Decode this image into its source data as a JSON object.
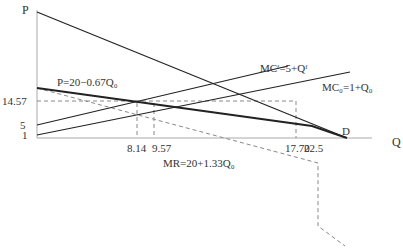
{
  "axes": {
    "y_label": "P",
    "x_label": "Q"
  },
  "y_ticks": [
    {
      "label": "14.57",
      "y": 101
    },
    {
      "label": "5",
      "y": 125
    },
    {
      "label": "1",
      "y": 135
    }
  ],
  "x_ticks": [
    {
      "label": "8.14",
      "x": 137
    },
    {
      "label": "9.57",
      "x": 154
    },
    {
      "label": "17.70",
      "x": 296
    },
    {
      "label": "22.5",
      "x": 312
    }
  ],
  "curves": {
    "demand_total_label": "P=20−0.67Q₀",
    "mc_f_label": "MCᶠ=5+Qᶠ",
    "mc_0_label": "MC₀=1+Q₀",
    "mr_label": "MR=20+1.33Q₀",
    "d_label": "D"
  },
  "colors": {
    "line": "#222222",
    "axis": "#aaaaaa",
    "dash": "#888888",
    "text": "#333333"
  }
}
